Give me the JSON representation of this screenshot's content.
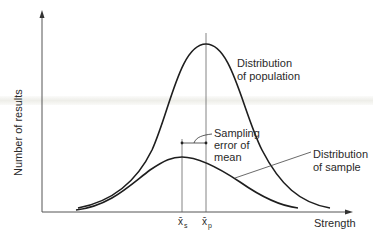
{
  "diagram": {
    "y_axis_label": "Number of results",
    "x_axis_label": "Strength",
    "labels": {
      "population": [
        "Distribution",
        "of population"
      ],
      "sample": [
        "Distribution",
        "of sample"
      ],
      "sampling_error": [
        "Sampling",
        "error of",
        "mean"
      ]
    },
    "markers": {
      "sample_mean": {
        "symbol": "x̄",
        "subscript": "s"
      },
      "population_mean": {
        "symbol": "x̄",
        "subscript": "p"
      }
    },
    "colors": {
      "line": "#1e1e1e",
      "axis": "#555555",
      "text": "#2a2a2a",
      "band": "#eeeee9"
    }
  }
}
